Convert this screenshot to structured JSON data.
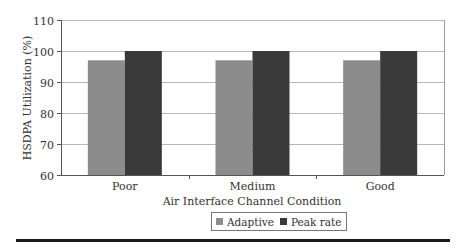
{
  "chart_data": {
    "type": "bar",
    "title": "",
    "xlabel": "Air Interface Channel Condition",
    "ylabel": "HSDPA Utilization (%)",
    "ylim": [
      60,
      110
    ],
    "yticks": [
      60,
      70,
      80,
      90,
      100,
      110
    ],
    "grid": true,
    "legend_position": "bottom",
    "categories": [
      "Poor",
      "Medium",
      "Good"
    ],
    "series": [
      {
        "name": "Adaptive",
        "values": [
          97,
          97,
          97
        ],
        "color": "#8c8c8c"
      },
      {
        "name": "Peak rate",
        "values": [
          100,
          100,
          100
        ],
        "color": "#3a3a3a"
      }
    ]
  },
  "legend": {
    "items": [
      {
        "label": "Adaptive",
        "color": "#8c8c8c"
      },
      {
        "label": "Peak rate",
        "color": "#3a3a3a"
      }
    ]
  }
}
